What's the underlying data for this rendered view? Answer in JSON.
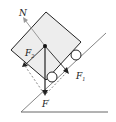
{
  "diagram": {
    "type": "free-body-diagram",
    "labels": {
      "normal": "N",
      "f2": "F",
      "f2_sub": "2",
      "f1": "F",
      "f1_sub": "1",
      "weight": "F",
      "weight_sub": "'"
    },
    "colors": {
      "box_fill": "#ededed",
      "stroke": "#222222",
      "normal_arrow": "#999999",
      "dashed": "#555555"
    }
  }
}
